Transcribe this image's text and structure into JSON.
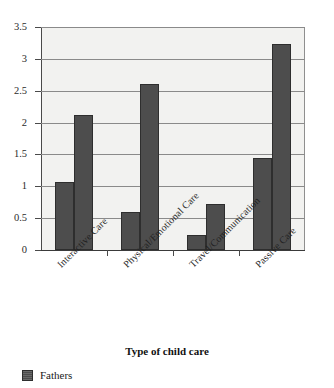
{
  "chart_data": {
    "type": "bar",
    "title": "",
    "xlabel": "Type of child care",
    "ylabel": "",
    "ylim": [
      0,
      3.5
    ],
    "yticks": [
      "0",
      "0.5",
      "1",
      "1.5",
      "2",
      "2.5",
      "3",
      "3.5"
    ],
    "ytick_values": [
      0,
      0.5,
      1,
      1.5,
      2,
      2.5,
      3,
      3.5
    ],
    "grid": true,
    "legend_position": "bottom-left",
    "categories": [
      "Interactive Care",
      "Physical/Emotional Care",
      "Travel/Communication",
      "Passive Care"
    ],
    "series": [
      {
        "name": "Series 1",
        "color": "#4d4d4d",
        "values": [
          1.07,
          0.6,
          0.24,
          1.44
        ]
      },
      {
        "name": "Fathers",
        "color": "#4d4d4d",
        "values": [
          2.12,
          2.6,
          0.72,
          3.24
        ]
      }
    ]
  },
  "legend": {
    "entries": [
      {
        "label": "Fathers",
        "color": "#4d4d4d"
      }
    ]
  }
}
